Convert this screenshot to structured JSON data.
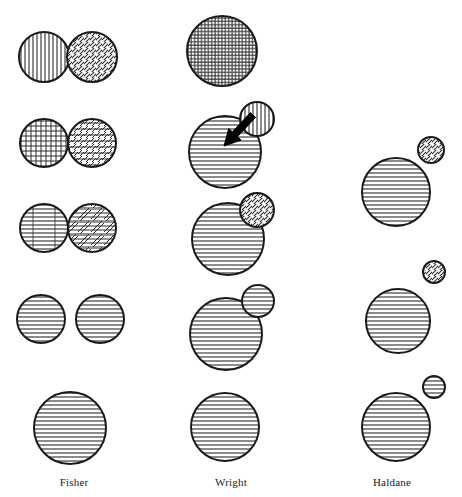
{
  "figure": {
    "type": "diagram",
    "background_color": "#ffffff",
    "stroke_color": "#1a1a1a",
    "hatch_color": "#2b2b2b",
    "arrow_color": "#000000",
    "width": 462,
    "height": 497
  },
  "columns": [
    {
      "id": "fisher",
      "label": "Fisher",
      "label_x": 74,
      "label_y": 476
    },
    {
      "id": "wright",
      "label": "Wright",
      "label_x": 231,
      "label_y": 476
    },
    {
      "id": "haldane",
      "label": "Haldane",
      "label_x": 392,
      "label_y": 476
    }
  ],
  "shapes": [
    {
      "name": "fisher-stage1-circle-left",
      "column": "fisher",
      "stage": 1,
      "cx": 44,
      "cy": 57,
      "r": 25,
      "fill": "vertical",
      "role": "population"
    },
    {
      "name": "fisher-stage1-circle-right",
      "column": "fisher",
      "stage": 1,
      "cx": 92,
      "cy": 57,
      "r": 25,
      "fill": "diagonal",
      "role": "population"
    },
    {
      "name": "fisher-stage2-circle-left",
      "column": "fisher",
      "stage": 2,
      "cx": 44,
      "cy": 143,
      "r": 24,
      "fill": "crosshatch",
      "role": "population"
    },
    {
      "name": "fisher-stage2-circle-right",
      "column": "fisher",
      "stage": 2,
      "cx": 92,
      "cy": 143,
      "r": 24,
      "fill": "diag-horiz",
      "role": "population"
    },
    {
      "name": "fisher-stage3-circle-left",
      "column": "fisher",
      "stage": 3,
      "cx": 44,
      "cy": 228,
      "r": 24,
      "fill": "horiz-vert",
      "role": "population"
    },
    {
      "name": "fisher-stage3-circle-right",
      "column": "fisher",
      "stage": 3,
      "cx": 92,
      "cy": 228,
      "r": 24,
      "fill": "horiz-diag",
      "role": "population"
    },
    {
      "name": "fisher-stage4-circle-left",
      "column": "fisher",
      "stage": 4,
      "cx": 41,
      "cy": 319,
      "r": 24,
      "fill": "horizontal",
      "role": "population"
    },
    {
      "name": "fisher-stage4-circle-right",
      "column": "fisher",
      "stage": 4,
      "cx": 100,
      "cy": 319,
      "r": 24,
      "fill": "horizontal",
      "role": "population"
    },
    {
      "name": "fisher-stage5-circle",
      "column": "fisher",
      "stage": 5,
      "cx": 70,
      "cy": 428,
      "r": 36,
      "fill": "horizontal",
      "role": "population"
    },
    {
      "name": "wright-stage1-circle",
      "column": "wright",
      "stage": 1,
      "cx": 222,
      "cy": 51,
      "r": 35,
      "fill": "fine-grid",
      "role": "population"
    },
    {
      "name": "wright-stage2-main",
      "column": "wright",
      "stage": 2,
      "cx": 225,
      "cy": 152,
      "r": 36,
      "fill": "horizontal",
      "role": "population"
    },
    {
      "name": "wright-stage2-deme",
      "column": "wright",
      "stage": 2,
      "cx": 257,
      "cy": 119,
      "r": 17,
      "fill": "vertical",
      "role": "subpopulation"
    },
    {
      "name": "wright-stage3-main",
      "column": "wright",
      "stage": 3,
      "cx": 228,
      "cy": 239,
      "r": 36,
      "fill": "horizontal",
      "role": "population"
    },
    {
      "name": "wright-stage3-deme",
      "column": "wright",
      "stage": 3,
      "cx": 257,
      "cy": 210,
      "r": 17,
      "fill": "diagonal",
      "role": "subpopulation"
    },
    {
      "name": "wright-stage4-main",
      "column": "wright",
      "stage": 4,
      "cx": 226,
      "cy": 334,
      "r": 36,
      "fill": "horizontal",
      "role": "population"
    },
    {
      "name": "wright-stage4-deme",
      "column": "wright",
      "stage": 4,
      "cx": 258,
      "cy": 301,
      "r": 16,
      "fill": "horizontal",
      "role": "subpopulation"
    },
    {
      "name": "wright-stage5-circle",
      "column": "wright",
      "stage": 5,
      "cx": 225,
      "cy": 427,
      "r": 34,
      "fill": "horizontal",
      "role": "population"
    },
    {
      "name": "haldane-stage2-main",
      "column": "haldane",
      "stage": 2,
      "cx": 396,
      "cy": 192,
      "r": 34,
      "fill": "horizontal",
      "role": "population"
    },
    {
      "name": "haldane-stage2-mutant",
      "column": "haldane",
      "stage": 2,
      "cx": 431,
      "cy": 150,
      "r": 13,
      "fill": "diagonal",
      "role": "mutant"
    },
    {
      "name": "haldane-stage4-main",
      "column": "haldane",
      "stage": 4,
      "cx": 398,
      "cy": 321,
      "r": 32,
      "fill": "horizontal",
      "role": "population"
    },
    {
      "name": "haldane-stage4-mutant",
      "column": "haldane",
      "stage": 4,
      "cx": 434,
      "cy": 272,
      "r": 11,
      "fill": "diagonal",
      "role": "mutant"
    },
    {
      "name": "haldane-stage5-main",
      "column": "haldane",
      "stage": 5,
      "cx": 396,
      "cy": 427,
      "r": 34,
      "fill": "horizontal",
      "role": "population"
    },
    {
      "name": "haldane-stage5-mutant",
      "column": "haldane",
      "stage": 5,
      "cx": 434,
      "cy": 387,
      "r": 11,
      "fill": "horizontal",
      "role": "mutant"
    }
  ],
  "arrows": [
    {
      "name": "wright-stage2-migration-arrow",
      "column": "wright",
      "stage": 2,
      "x1": 253,
      "y1": 115,
      "x2": 224,
      "y2": 146,
      "width": 7,
      "head_length": 16,
      "head_width": 17
    }
  ]
}
